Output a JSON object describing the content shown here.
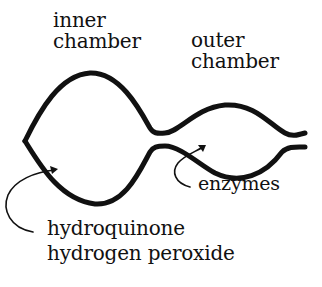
{
  "diagram": {
    "labels": {
      "inner_chamber": [
        "inner",
        "chamber"
      ],
      "outer_chamber": [
        "outer",
        "chamber"
      ],
      "enzymes": "enzymes",
      "inner_contents": [
        "hydroquinone",
        "hydrogen peroxide"
      ]
    },
    "colors": {
      "ink": "#111111",
      "background": "#ffffff"
    }
  }
}
